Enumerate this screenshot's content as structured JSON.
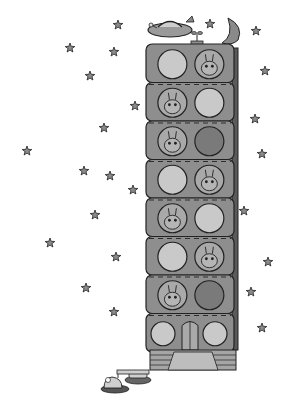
{
  "illustration": {
    "subject": "space apartment tower with aliens in windows",
    "colors": {
      "background": "#ffffff",
      "building": "#8e8e8e",
      "building_dark": "#5a5a5a",
      "window_light": "#c9c9c9",
      "window_mid": "#a9a9a9",
      "window_dark": "#7a7a7a",
      "outline": "#222222",
      "star_fill": "#8a8a8a"
    },
    "floors": [
      {
        "left": "empty",
        "right": "robot"
      },
      {
        "left": "antenna-alien",
        "right": "empty"
      },
      {
        "left": "striped-alien",
        "right": "dark-empty"
      },
      {
        "left": "empty",
        "right": "beaked-bird"
      },
      {
        "left": "wizard-hat-creature",
        "right": "empty"
      },
      {
        "left": "empty",
        "right": "bus-creature"
      },
      {
        "left": "spotted-bunny",
        "right": "dark-empty"
      },
      {
        "left": "empty",
        "right": "empty"
      }
    ],
    "top_objects": [
      "ufo",
      "sprout",
      "crescent-moon"
    ],
    "ground_objects": [
      "periscope-creature",
      "manhole-hatch"
    ],
    "star_count": 24
  }
}
